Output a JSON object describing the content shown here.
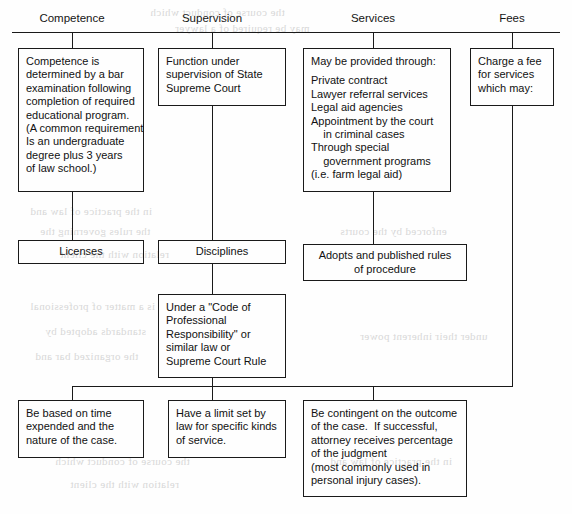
{
  "diagram": {
    "type": "flowchart",
    "columns": [
      {
        "label": "Competence"
      },
      {
        "label": "Supervision"
      },
      {
        "label": "Services"
      },
      {
        "label": "Fees"
      }
    ],
    "nodes": {
      "competence_detail": {
        "name": "competence-detail-box",
        "lines": [
          "Competence is",
          "determined by a bar",
          "examination following",
          "completion of required",
          "educational program.",
          "(A common requirement",
          "Is an undergraduate",
          "degree plus 3 years",
          "of law school.)"
        ]
      },
      "licenses": {
        "name": "licenses-box",
        "lines": [
          "Licenses"
        ]
      },
      "supervision_detail": {
        "name": "supervision-detail-box",
        "lines": [
          "Function under",
          "supervision of State",
          "Supreme Court"
        ]
      },
      "disciplines": {
        "name": "disciplines-box",
        "lines": [
          "Disciplines"
        ]
      },
      "code_of_responsibility": {
        "name": "code-of-responsibility-box",
        "lines": [
          "Under a \"Code of",
          "Professional",
          "Responsibility\" or",
          "similar law or",
          "Supreme Court Rule"
        ]
      },
      "services_detail": {
        "name": "services-detail-box",
        "lines": [
          "May be provided through:",
          "",
          "Private contract",
          "Lawyer referral services",
          "Legal aid agencies",
          "Appointment by the court",
          "    in criminal cases",
          "Through special",
          "    government programs",
          "(i.e. farm legal aid)"
        ]
      },
      "rules_of_procedure": {
        "name": "rules-of-procedure-box",
        "lines": [
          "Adopts and published rules",
          "of procedure"
        ]
      },
      "fees_detail": {
        "name": "fees-detail-box",
        "lines": [
          "Charge a fee",
          "for services",
          "which may:"
        ]
      },
      "fee_time_based": {
        "name": "fee-time-based-box",
        "lines": [
          "Be based on time",
          "expended and the",
          "nature of the case."
        ]
      },
      "fee_statutory_limit": {
        "name": "fee-statutory-limit-box",
        "lines": [
          "Have a limit set by",
          "law for specific kinds",
          "of service."
        ]
      },
      "fee_contingent": {
        "name": "fee-contingent-box",
        "lines": [
          "Be contingent on the outcome",
          "of the case.  If successful,",
          "attorney receives percentage",
          "of the judgment",
          "(most commonly used in",
          "personal injury cases)."
        ]
      }
    },
    "colors": {
      "ink": "#1a1a1a",
      "paper": "#fefefe",
      "bleed_through": "#b9b9b9"
    },
    "bleed_through_text": [
      "the course of conduct which",
      "may be required of a lawyer",
      "in the practice of law and",
      "the rules governing the",
      "relation with the client",
      "is a matter of professional",
      "standards adopted by",
      "the organized bar and",
      "enforced by the courts",
      "under their inherent power"
    ]
  }
}
